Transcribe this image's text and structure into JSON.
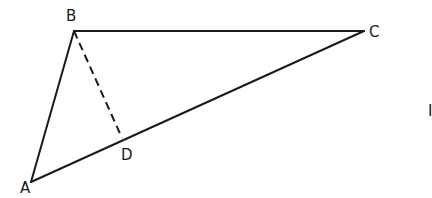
{
  "diagram": {
    "type": "geometry-triangle",
    "points": {
      "A": {
        "label": "A",
        "x": 31,
        "y": 182,
        "label_x": 20,
        "label_y": 193
      },
      "B": {
        "label": "B",
        "x": 74,
        "y": 31,
        "label_x": 66,
        "label_y": 21
      },
      "C": {
        "label": "C",
        "x": 364,
        "y": 31,
        "label_x": 369,
        "label_y": 37
      },
      "D": {
        "label": "D",
        "x": 122,
        "y": 138,
        "label_x": 122,
        "label_y": 160
      }
    },
    "segments": [
      {
        "from": "A",
        "to": "B",
        "style": "solid"
      },
      {
        "from": "B",
        "to": "C",
        "style": "solid"
      },
      {
        "from": "C",
        "to": "A",
        "style": "solid"
      },
      {
        "from": "B",
        "to": "D",
        "style": "dashed"
      }
    ],
    "stroke_color": "#1a1a1a",
    "background": "#ffffff",
    "edge_mark": "I"
  }
}
